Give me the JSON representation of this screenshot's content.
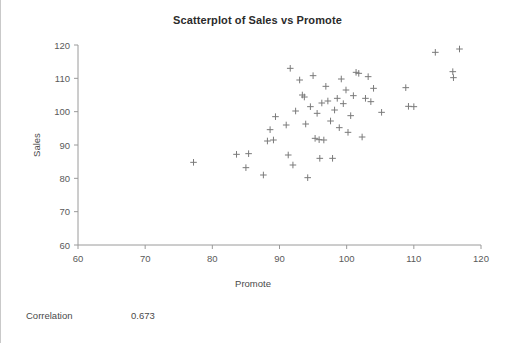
{
  "chart_data": {
    "type": "scatter",
    "title": "Scatterplot of Sales vs Promote",
    "xlabel": "Promote",
    "ylabel": "Sales",
    "xlim": [
      60,
      120
    ],
    "ylim": [
      60,
      120
    ],
    "xticks": [
      60,
      70,
      80,
      90,
      100,
      110,
      120
    ],
    "yticks": [
      60,
      70,
      80,
      90,
      100,
      110,
      120
    ],
    "grid": false,
    "legend": null,
    "marker": "plus",
    "marker_color": "#7a7a7a",
    "points": [
      [
        77.2,
        84.8
      ],
      [
        83.6,
        87.2
      ],
      [
        85.0,
        83.2
      ],
      [
        85.4,
        87.4
      ],
      [
        87.6,
        81.0
      ],
      [
        88.2,
        91.2
      ],
      [
        88.6,
        94.6
      ],
      [
        89.1,
        91.5
      ],
      [
        89.4,
        98.5
      ],
      [
        91.0,
        96.0
      ],
      [
        91.3,
        87.0
      ],
      [
        91.6,
        113.0
      ],
      [
        92.0,
        84.0
      ],
      [
        92.4,
        100.2
      ],
      [
        93.0,
        109.5
      ],
      [
        93.4,
        105.0
      ],
      [
        93.7,
        104.4
      ],
      [
        93.9,
        96.3
      ],
      [
        94.2,
        80.2
      ],
      [
        94.6,
        101.5
      ],
      [
        95.0,
        110.8
      ],
      [
        95.3,
        92.0
      ],
      [
        95.6,
        99.5
      ],
      [
        95.9,
        91.6
      ],
      [
        96.0,
        86.0
      ],
      [
        96.3,
        102.6
      ],
      [
        96.6,
        91.5
      ],
      [
        96.9,
        107.6
      ],
      [
        97.2,
        103.2
      ],
      [
        97.6,
        97.2
      ],
      [
        97.9,
        86.0
      ],
      [
        98.2,
        100.5
      ],
      [
        98.6,
        104.0
      ],
      [
        98.9,
        95.2
      ],
      [
        99.2,
        109.8
      ],
      [
        99.5,
        102.4
      ],
      [
        99.9,
        106.5
      ],
      [
        100.2,
        93.8
      ],
      [
        100.6,
        98.8
      ],
      [
        101.0,
        104.8
      ],
      [
        101.4,
        111.8
      ],
      [
        101.8,
        111.5
      ],
      [
        102.3,
        92.4
      ],
      [
        102.8,
        104.0
      ],
      [
        103.2,
        110.5
      ],
      [
        103.6,
        103.0
      ],
      [
        104.0,
        107.0
      ],
      [
        105.2,
        99.8
      ],
      [
        108.8,
        107.2
      ],
      [
        109.2,
        101.6
      ],
      [
        110.0,
        101.5
      ],
      [
        113.2,
        117.8
      ],
      [
        115.8,
        112.0
      ],
      [
        115.9,
        110.2
      ],
      [
        116.8,
        118.8
      ]
    ]
  },
  "footer": {
    "correlation_label": "Correlation",
    "correlation_value": "0.673"
  }
}
